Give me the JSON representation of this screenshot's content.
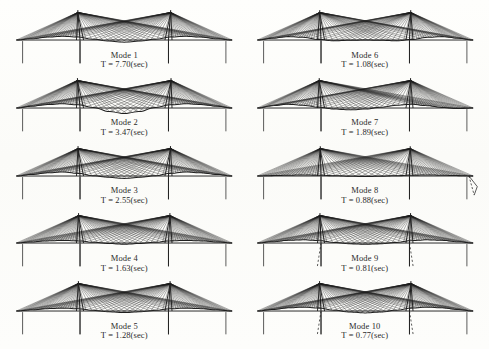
{
  "figure": {
    "type": "mode-shape-diagram",
    "columns": 2,
    "rows": 5,
    "background_color": "#fdfdfb",
    "ink_color": "#1f1f1f"
  },
  "modes": [
    {
      "id": 1,
      "name": "Mode 1",
      "period_label": "T = 7.70(sec)",
      "period_value": 7.7,
      "unit": "sec",
      "shape": "symmetric-double-hump-deck-lateral",
      "deck_wave": [
        0,
        -1,
        -2.2,
        -2.8,
        -2.2,
        -0.6,
        0.8,
        1.6,
        0.8,
        -0.6,
        -2.2,
        -2.8,
        -2.2,
        -1,
        0
      ],
      "tower_sway": [
        -2.4,
        2.4
      ],
      "cable_density": 26,
      "dashed_deck": false,
      "end_flag": false,
      "column": "left"
    },
    {
      "id": 2,
      "name": "Mode 2",
      "period_label": "T = 3.47(sec)",
      "period_value": 3.47,
      "unit": "sec",
      "shape": "antisymmetric-mid-span-loop",
      "deck_wave": [
        0,
        -1.4,
        -2.6,
        -3.2,
        -2.4,
        -0.4,
        2.6,
        4.2,
        2.6,
        -0.4,
        -2.4,
        -3.2,
        -2.6,
        -1.4,
        0
      ],
      "tower_sway": [
        -2.8,
        2.8
      ],
      "cable_density": 26,
      "dashed_deck": false,
      "end_flag": false,
      "column": "left"
    },
    {
      "id": 3,
      "name": "Mode 3",
      "period_label": "T = 2.55(sec)",
      "period_value": 2.55,
      "unit": "sec",
      "shape": "symmetric-side-span-dominant",
      "deck_wave": [
        0,
        -1.2,
        -2.4,
        -3.0,
        -2.0,
        -0.2,
        1.0,
        1.8,
        1.0,
        -0.2,
        -2.0,
        -3.0,
        -2.4,
        -1.2,
        0
      ],
      "tower_sway": [
        -2.2,
        2.2
      ],
      "cable_density": 26,
      "dashed_deck": false,
      "end_flag": false,
      "column": "left"
    },
    {
      "id": 4,
      "name": "Mode 4",
      "period_label": "T = 1.63(sec)",
      "period_value": 1.63,
      "unit": "sec",
      "shape": "flat-deck-tower-bending",
      "deck_wave": [
        0,
        -0.8,
        -1.6,
        -2.0,
        -1.6,
        -0.6,
        0.4,
        0.9,
        0.4,
        -0.6,
        -1.6,
        -2.0,
        -1.6,
        -0.8,
        0
      ],
      "tower_sway": [
        -1.6,
        1.6
      ],
      "cable_density": 26,
      "dashed_deck": false,
      "end_flag": false,
      "column": "left"
    },
    {
      "id": 5,
      "name": "Mode 5",
      "period_label": "T = 1.28(sec)",
      "period_value": 1.28,
      "unit": "sec",
      "shape": "symmetric-low-amplitude",
      "deck_wave": [
        0,
        -0.9,
        -1.8,
        -2.2,
        -1.7,
        -0.5,
        0.6,
        1.2,
        0.6,
        -0.5,
        -1.7,
        -2.2,
        -1.8,
        -0.9,
        0
      ],
      "tower_sway": [
        -1.8,
        1.8
      ],
      "cable_density": 26,
      "dashed_deck": false,
      "end_flag": false,
      "column": "left"
    },
    {
      "id": 6,
      "name": "Mode 6",
      "period_label": "T = 1.08(sec)",
      "period_value": 1.08,
      "unit": "sec",
      "shape": "side-span-scallop",
      "deck_wave": [
        0,
        -1.4,
        -2.6,
        -2.0,
        -0.4,
        0.6,
        0.2,
        0,
        0.2,
        0.6,
        -0.4,
        -2.0,
        -2.6,
        -1.4,
        0
      ],
      "tower_sway": [
        -1.4,
        1.4
      ],
      "cable_density": 26,
      "dashed_deck": false,
      "end_flag": false,
      "column": "right"
    },
    {
      "id": 7,
      "name": "Mode 7",
      "period_label": "T = 1.89(sec)",
      "period_value": 1.89,
      "unit": "sec",
      "shape": "asymmetric-side-span",
      "deck_wave": [
        0,
        -1.8,
        -2.8,
        -2.0,
        -0.6,
        0.8,
        1.4,
        0.8,
        -0.6,
        -2.0,
        -2.8,
        -1.8,
        -0.4,
        0.4,
        0
      ],
      "tower_sway": [
        -2.0,
        1.2
      ],
      "cable_density": 26,
      "dashed_deck": false,
      "end_flag": false,
      "column": "right"
    },
    {
      "id": 8,
      "name": "Mode 8",
      "period_label": "T = 0.88(sec)",
      "period_value": 0.88,
      "unit": "sec",
      "shape": "clean-fan-with-end-deflection",
      "deck_wave": [
        0,
        -0.3,
        -0.6,
        -0.8,
        -0.6,
        -0.2,
        0.2,
        0.4,
        0.2,
        -0.2,
        -0.6,
        -0.8,
        -0.6,
        -0.3,
        0
      ],
      "tower_sway": [
        -0.8,
        0.8
      ],
      "cable_density": 22,
      "dashed_deck": false,
      "end_flag": true,
      "column": "right"
    },
    {
      "id": 9,
      "name": "Mode 9",
      "period_label": "T = 0.81(sec)",
      "period_value": 0.81,
      "unit": "sec",
      "shape": "tower-leg-dashed-deflection",
      "deck_wave": [
        0,
        -1.0,
        -2.0,
        -2.4,
        -1.8,
        -0.4,
        0.6,
        1.0,
        0.6,
        -0.4,
        -1.8,
        -2.4,
        -2.0,
        -1.0,
        0
      ],
      "tower_sway": [
        -1.2,
        1.2
      ],
      "cable_density": 26,
      "dashed_deck": true,
      "end_flag": false,
      "column": "right"
    },
    {
      "id": 10,
      "name": "Mode 10",
      "period_label": "T = 0.77(sec)",
      "period_value": 0.77,
      "unit": "sec",
      "shape": "symmetric-high-order",
      "deck_wave": [
        0,
        -1.2,
        -2.4,
        -2.9,
        -2.2,
        -0.6,
        0.8,
        1.4,
        0.8,
        -0.6,
        -2.2,
        -2.9,
        -2.4,
        -1.2,
        0
      ],
      "tower_sway": [
        -1.6,
        1.6
      ],
      "cable_density": 28,
      "dashed_deck": true,
      "end_flag": false,
      "column": "right"
    }
  ]
}
